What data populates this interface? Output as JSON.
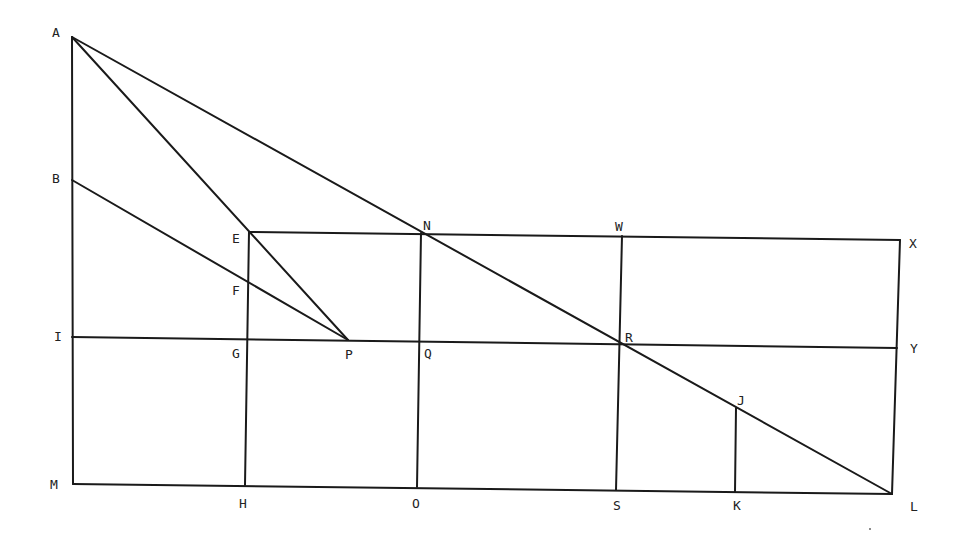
{
  "figure": {
    "type": "geometric-construction",
    "width": 965,
    "height": 538,
    "line_color": "#1a1a1a",
    "label_color": "#222222",
    "points": {
      "A": [
        72,
        37
      ],
      "B": [
        72,
        180
      ],
      "I": [
        72,
        337
      ],
      "M": [
        73,
        484
      ],
      "E": [
        249,
        232
      ],
      "F": [
        248,
        283
      ],
      "G": [
        248,
        340
      ],
      "H": [
        245,
        485
      ],
      "P": [
        348,
        340
      ],
      "N": [
        421,
        233
      ],
      "Q": [
        420,
        341
      ],
      "O": [
        417,
        487
      ],
      "W": [
        622,
        236
      ],
      "R": [
        619,
        344
      ],
      "S": [
        616,
        490
      ],
      "X": [
        900,
        240
      ],
      "Y": [
        897,
        348
      ],
      "L": [
        892,
        494
      ],
      "J": [
        736,
        408
      ],
      "K": [
        735,
        492
      ]
    },
    "segments": [
      [
        "A",
        "M"
      ],
      [
        "A",
        "L"
      ],
      [
        "A",
        "P"
      ],
      [
        "B",
        "P"
      ],
      [
        "E",
        "X"
      ],
      [
        "I",
        "Y"
      ],
      [
        "M",
        "L"
      ],
      [
        "X",
        "L"
      ],
      [
        "E",
        "H"
      ],
      [
        "N",
        "O"
      ],
      [
        "W",
        "S"
      ],
      [
        "J",
        "K"
      ]
    ],
    "labels": [
      {
        "text": "A",
        "x": 52,
        "y": 26
      },
      {
        "text": "B",
        "x": 52,
        "y": 172
      },
      {
        "text": "I",
        "x": 54,
        "y": 330
      },
      {
        "text": "M",
        "x": 50,
        "y": 478
      },
      {
        "text": "E",
        "x": 232,
        "y": 232
      },
      {
        "text": "F",
        "x": 232,
        "y": 284
      },
      {
        "text": "G",
        "x": 232,
        "y": 347
      },
      {
        "text": "H",
        "x": 239,
        "y": 497
      },
      {
        "text": "P",
        "x": 345,
        "y": 348
      },
      {
        "text": "N",
        "x": 423,
        "y": 219
      },
      {
        "text": "Q",
        "x": 424,
        "y": 347
      },
      {
        "text": "O",
        "x": 412,
        "y": 497
      },
      {
        "text": "W",
        "x": 615,
        "y": 220
      },
      {
        "text": "R",
        "x": 625,
        "y": 331
      },
      {
        "text": "S",
        "x": 613,
        "y": 499
      },
      {
        "text": "X",
        "x": 909,
        "y": 237
      },
      {
        "text": "Y",
        "x": 910,
        "y": 342
      },
      {
        "text": "J",
        "x": 737,
        "y": 394
      },
      {
        "text": "K",
        "x": 733,
        "y": 499
      },
      {
        "text": "L",
        "x": 910,
        "y": 500
      }
    ]
  }
}
